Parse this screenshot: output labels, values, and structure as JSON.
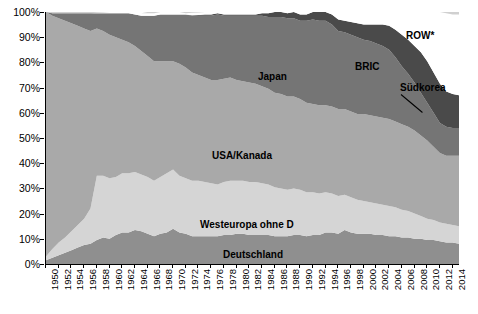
{
  "chart_data": {
    "type": "area",
    "stacked": true,
    "normalized": true,
    "title": "",
    "subtitle": "",
    "xlabel": "",
    "ylabel": "",
    "grid": false,
    "legend_position": "inline-annotations",
    "xlim": [
      1950,
      2015
    ],
    "ylim": [
      0,
      100
    ],
    "y_tick_labels": [
      "0%",
      "10%",
      "20%",
      "30%",
      "40%",
      "50%",
      "60%",
      "70%",
      "80%",
      "90%",
      "100%"
    ],
    "y_ticks": [
      0,
      10,
      20,
      30,
      40,
      50,
      60,
      70,
      80,
      90,
      100
    ],
    "x_tick_labels": [
      "1950",
      "1952",
      "1954",
      "1956",
      "1958",
      "1960",
      "1962",
      "1964",
      "1966",
      "1968",
      "1970",
      "1972",
      "1974",
      "1976",
      "1978",
      "1980",
      "1982",
      "1984",
      "1986",
      "1988",
      "1990",
      "1992",
      "1994",
      "1996",
      "1998",
      "2000",
      "2002",
      "2004",
      "2006",
      "2008",
      "2010",
      "2012",
      "2014"
    ],
    "x_ticks": [
      1950,
      1952,
      1954,
      1956,
      1958,
      1960,
      1962,
      1964,
      1966,
      1968,
      1970,
      1972,
      1974,
      1976,
      1978,
      1980,
      1982,
      1984,
      1986,
      1988,
      1990,
      1992,
      1994,
      1996,
      1998,
      2000,
      2002,
      2004,
      2006,
      2008,
      2010,
      2012,
      2014
    ],
    "x": [
      1950,
      1951,
      1952,
      1953,
      1954,
      1955,
      1956,
      1957,
      1958,
      1959,
      1960,
      1961,
      1962,
      1963,
      1964,
      1965,
      1966,
      1967,
      1968,
      1969,
      1970,
      1971,
      1972,
      1973,
      1974,
      1975,
      1976,
      1977,
      1978,
      1979,
      1980,
      1981,
      1982,
      1983,
      1984,
      1985,
      1986,
      1987,
      1988,
      1989,
      1990,
      1991,
      1992,
      1993,
      1994,
      1995,
      1996,
      1997,
      1998,
      1999,
      2000,
      2001,
      2002,
      2003,
      2004,
      2005,
      2006,
      2007,
      2008,
      2009,
      2010,
      2011,
      2012,
      2013,
      2014,
      2015
    ],
    "series": [
      {
        "name": "Deutschland",
        "color": "#8f8f8f",
        "values": [
          1.5,
          2.5,
          3.5,
          4.5,
          5.5,
          6.5,
          7.5,
          8.0,
          9.5,
          10.5,
          10.0,
          11.5,
          12.5,
          12.5,
          13.5,
          13.0,
          12.0,
          11.0,
          12.0,
          12.5,
          14.0,
          12.5,
          12.0,
          11.0,
          11.0,
          11.0,
          11.0,
          11.0,
          11.5,
          11.5,
          12.0,
          12.0,
          11.5,
          11.5,
          11.5,
          11.5,
          11.0,
          11.0,
          11.0,
          11.5,
          11.5,
          11.0,
          11.5,
          11.5,
          12.5,
          12.5,
          12.0,
          13.5,
          12.5,
          12.0,
          12.0,
          12.0,
          11.5,
          11.5,
          11.0,
          11.0,
          10.5,
          10.5,
          10.0,
          10.0,
          9.5,
          9.5,
          9.0,
          8.5,
          8.5,
          8.0
        ]
      },
      {
        "name": "Westeuropa ohne D",
        "color": "#d5d5d5",
        "values": [
          1.5,
          3.5,
          5.0,
          6.0,
          7.5,
          9.0,
          10.5,
          14.0,
          25.5,
          24.5,
          24.0,
          23.0,
          23.5,
          23.5,
          23.0,
          22.5,
          22.5,
          22.0,
          22.5,
          23.5,
          23.5,
          22.5,
          22.0,
          22.0,
          22.0,
          21.5,
          21.0,
          20.5,
          21.0,
          21.5,
          21.0,
          21.0,
          21.0,
          21.0,
          20.5,
          20.0,
          19.5,
          19.0,
          18.5,
          18.5,
          18.0,
          17.5,
          17.0,
          16.5,
          16.0,
          15.5,
          15.0,
          14.0,
          14.0,
          13.5,
          13.0,
          12.5,
          12.5,
          12.0,
          12.0,
          11.5,
          11.0,
          10.5,
          10.0,
          9.0,
          8.5,
          8.0,
          7.5,
          7.5,
          7.0,
          7.0
        ]
      },
      {
        "name": "USA/Kanada",
        "color": "#a9a9a9",
        "values": [
          97.0,
          92.5,
          89.0,
          86.0,
          82.5,
          79.0,
          75.5,
          70.5,
          58.5,
          57.5,
          57.0,
          55.5,
          53.0,
          52.0,
          50.0,
          49.0,
          48.0,
          47.5,
          46.0,
          44.5,
          43.0,
          44.5,
          44.0,
          43.0,
          42.0,
          41.5,
          41.0,
          41.5,
          41.0,
          41.0,
          40.0,
          39.5,
          39.5,
          39.0,
          38.5,
          38.0,
          37.5,
          37.5,
          37.0,
          36.5,
          36.0,
          35.5,
          35.0,
          35.0,
          34.5,
          34.5,
          34.5,
          34.0,
          34.0,
          34.0,
          34.5,
          34.5,
          34.5,
          34.5,
          34.5,
          34.0,
          34.0,
          33.5,
          33.0,
          32.0,
          31.0,
          29.0,
          27.5,
          27.0,
          27.5,
          28.0
        ]
      },
      {
        "name": "Japan",
        "color": "#757575",
        "values": [
          0.0,
          1.0,
          2.0,
          3.0,
          4.0,
          5.0,
          6.0,
          7.0,
          6.0,
          7.0,
          8.5,
          9.5,
          10.5,
          11.5,
          12.5,
          14.0,
          16.0,
          18.0,
          18.5,
          18.5,
          18.5,
          19.5,
          21.0,
          22.5,
          23.5,
          24.5,
          25.5,
          26.0,
          25.0,
          24.5,
          25.5,
          26.0,
          26.5,
          27.0,
          28.0,
          28.5,
          30.0,
          30.5,
          31.0,
          31.0,
          31.0,
          32.5,
          33.5,
          33.5,
          33.5,
          32.5,
          31.0,
          30.5,
          30.5,
          30.5,
          29.5,
          29.5,
          29.0,
          28.5,
          27.5,
          25.5,
          23.0,
          21.0,
          19.0,
          17.0,
          15.0,
          13.5,
          12.0,
          11.5,
          11.0,
          11.0
        ]
      },
      {
        "name": "Südkorea",
        "color": "#4a4a4a",
        "values": [
          0.0,
          0.0,
          0.0,
          0.0,
          0.0,
          0.0,
          0.0,
          0.0,
          0.0,
          0.0,
          0.0,
          0.0,
          0.0,
          0.0,
          0.0,
          0.0,
          0.0,
          0.0,
          0.0,
          0.0,
          0.0,
          0.0,
          0.0,
          0.2,
          0.3,
          0.5,
          0.5,
          0.5,
          0.5,
          0.5,
          0.5,
          0.5,
          0.5,
          0.5,
          1.0,
          1.5,
          2.0,
          2.0,
          2.0,
          2.5,
          2.5,
          2.5,
          3.0,
          3.5,
          3.5,
          4.0,
          4.5,
          4.5,
          5.0,
          5.5,
          6.0,
          6.5,
          7.5,
          8.5,
          9.5,
          11.0,
          12.5,
          13.5,
          14.5,
          16.0,
          16.5,
          16.0,
          15.5,
          14.0,
          13.5,
          13.0
        ]
      },
      {
        "name": "BRIC",
        "color": "#ffffff",
        "values": [
          0.0,
          0.0,
          0.0,
          0.0,
          0.0,
          0.0,
          0.0,
          0.0,
          0.2,
          0.3,
          0.5,
          0.5,
          0.5,
          0.5,
          1.0,
          1.0,
          1.0,
          1.0,
          1.0,
          1.0,
          1.0,
          1.0,
          0.5,
          1.0,
          1.0,
          1.0,
          1.0,
          0.5,
          1.0,
          1.0,
          1.0,
          1.0,
          1.0,
          1.0,
          0.5,
          0.5,
          0.5,
          1.0,
          2.0,
          2.5,
          3.5,
          4.0,
          4.5,
          5.0,
          5.5,
          6.0,
          6.5,
          6.0,
          6.0,
          6.5,
          6.5,
          7.5,
          7.5,
          8.0,
          8.5,
          10.0,
          12.0,
          14.0,
          17.0,
          19.5,
          22.0,
          25.5,
          28.5,
          31.0,
          31.5,
          32.0
        ]
      },
      {
        "name": "ROW*",
        "color": "#d0d0d0",
        "values": [
          0.0,
          0.5,
          0.5,
          0.5,
          0.5,
          0.5,
          0.5,
          0.5,
          0.3,
          0.2,
          0.0,
          0.0,
          0.0,
          0.0,
          0.0,
          0.0,
          0.5,
          0.5,
          0.0,
          0.0,
          0.0,
          0.0,
          0.5,
          0.3,
          0.2,
          0.0,
          0.0,
          1.0,
          0.0,
          0.0,
          0.0,
          0.0,
          0.0,
          0.0,
          0.0,
          0.0,
          0.0,
          0.0,
          0.0,
          0.0,
          0.0,
          0.5,
          0.5,
          1.0,
          1.5,
          2.0,
          3.0,
          2.5,
          3.0,
          3.0,
          3.5,
          3.5,
          3.5,
          3.5,
          3.5,
          3.5,
          3.5,
          4.0,
          4.0,
          3.5,
          3.5,
          3.5,
          3.5,
          3.5,
          3.5,
          3.5
        ]
      }
    ],
    "annotations": [
      {
        "label": "ROW*",
        "x_px": 406,
        "y_px": 30
      },
      {
        "label": "BRIC",
        "x_px": 355,
        "y_px": 61
      },
      {
        "label": "Japan",
        "x_px": 258,
        "y_px": 71
      },
      {
        "label": "Südkorea",
        "x_px": 400,
        "y_px": 82
      },
      {
        "label": "USA/Kanada",
        "x_px": 212,
        "y_px": 150
      },
      {
        "label": "Westeuropa ohne D",
        "x_px": 200,
        "y_px": 219
      },
      {
        "label": "Deutschland",
        "x_px": 223,
        "y_px": 249
      }
    ],
    "colors": {
      "deutschland": "#8f8f8f",
      "westeuropa": "#d5d5d5",
      "usa_kanada": "#a9a9a9",
      "japan": "#757575",
      "suedkorea": "#4a4a4a",
      "bric": "#ffffff",
      "row": "#d0d0d0",
      "axis": "#000000",
      "text": "#000000"
    }
  }
}
